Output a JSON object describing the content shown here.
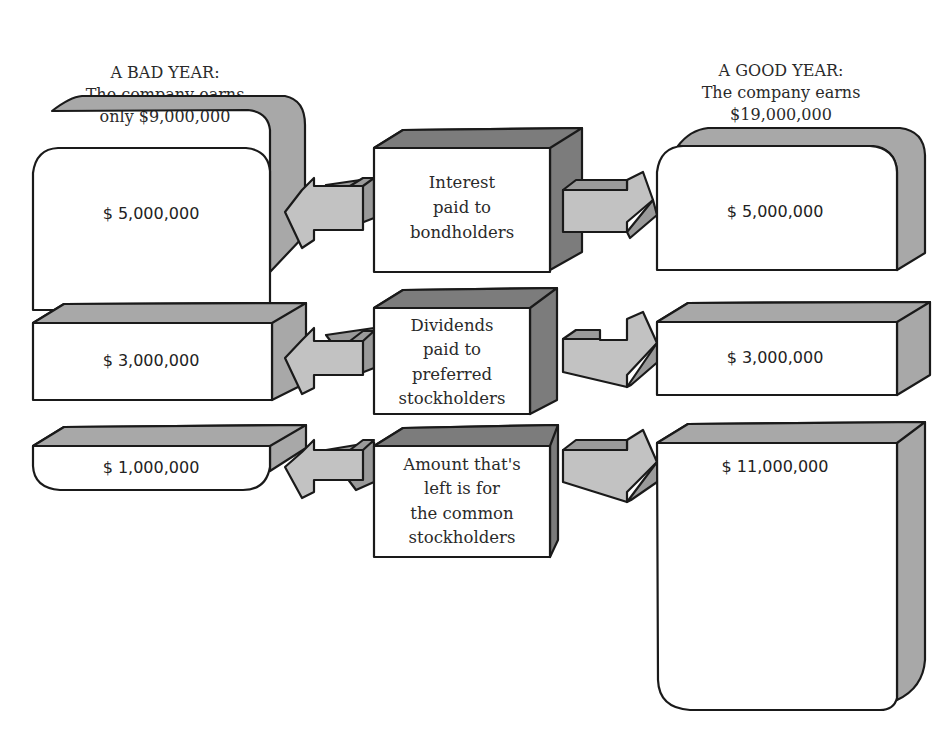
{
  "bad_year": {
    "title": "A BAD YEAR:",
    "line2": "The company earns",
    "line3": "only $9,000,000",
    "amounts": {
      "interest": "$  5,000,000",
      "preferred": "$  3,000,000",
      "common": "$  1,000,000"
    }
  },
  "good_year": {
    "title": "A GOOD YEAR:",
    "line2": "The company earns",
    "line3": "$19,000,000",
    "amounts": {
      "interest": "$  5,000,000",
      "preferred": "$  3,000,000",
      "common": "$  11,000,000"
    }
  },
  "categories": {
    "interest": [
      "Interest",
      "paid to",
      "bondholders"
    ],
    "preferred": [
      "Dividends",
      "paid to",
      "preferred",
      "stockholders"
    ],
    "common": [
      "Amount that's",
      "left is for",
      "the common",
      "stockholders"
    ]
  },
  "colors": {
    "side_fill": "#a8a8a8",
    "side_dark": "#7c7c7c",
    "arrow_fill": "#c2c2c2",
    "outline": "#1a1a1a"
  }
}
